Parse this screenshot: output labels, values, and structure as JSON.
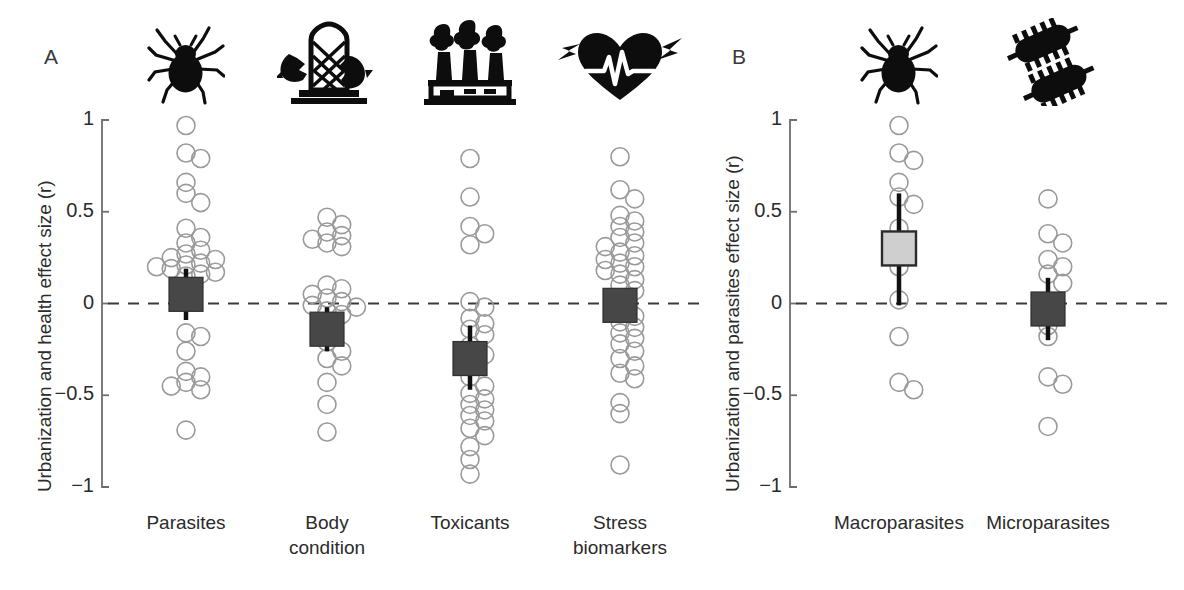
{
  "figure": {
    "width": 1184,
    "height": 590,
    "background": "#ffffff",
    "marker_edge_color": "#9a9a9a",
    "dark_square_color": "#474747",
    "light_square_color": "#cfcfcf",
    "square_edge_color": "#2b2b2b",
    "zero_line_color": "#3a3a3a",
    "axis_color": "#6e6e6e"
  },
  "panels": [
    {
      "letter": "A",
      "ylabel": "Urbanization and health effect size (r)",
      "yticks": [
        "1",
        "0.5",
        "0",
        "−0.5",
        "−1"
      ],
      "ytick_values": [
        1,
        0.5,
        0,
        -0.5,
        -1
      ],
      "ylim": [
        -1,
        1
      ],
      "zero_line": 0,
      "categories": [
        "Parasites",
        "Body\ncondition",
        "Toxicants",
        "Stress\nbiomarkers"
      ],
      "icons": [
        "tick-icon",
        "bird-feeder-icon",
        "factory-smokestack-icon",
        "heart-ecg-lightning-icon"
      ]
    },
    {
      "letter": "B",
      "ylabel": "Urbanization and parasites effect size (r)",
      "yticks": [
        "1",
        "0.5",
        "0",
        "−0.5",
        "−1"
      ],
      "ytick_values": [
        1,
        0.5,
        0,
        -0.5,
        -1
      ],
      "ylim": [
        -1,
        1
      ],
      "zero_line": 0,
      "categories": [
        "Macroparasites",
        "Microparasites"
      ],
      "icons": [
        "tick-icon",
        "bacteria-icon"
      ]
    }
  ],
  "chart_data": {
    "type": "scatter",
    "title": "",
    "subtitle": "",
    "xlabel": "",
    "ylabel_a": "Urbanization and health effect size (r)",
    "ylabel_b": "Urbanization and parasites effect size (r)",
    "ylim": [
      -1,
      1
    ],
    "yticks": [
      -1,
      -0.5,
      0,
      0.5,
      1
    ],
    "grid": false,
    "legend": "none",
    "reference_line": {
      "y": 0,
      "style": "dashed"
    },
    "panels": [
      {
        "letter": "A",
        "ylabel": "Urbanization and health effect size (r)",
        "groups": [
          {
            "name": "Parasites",
            "icon": "tick-icon",
            "summary": {
              "mean": 0.05,
              "ci_low": -0.09,
              "ci_high": 0.19,
              "marker": "filled-dark-square"
            },
            "points": [
              0.97,
              0.82,
              0.79,
              0.66,
              0.6,
              0.55,
              0.41,
              0.36,
              0.33,
              0.29,
              0.27,
              0.25,
              0.24,
              0.22,
              0.21,
              0.2,
              0.19,
              0.17,
              0.16,
              0.15,
              -0.16,
              -0.18,
              -0.26,
              -0.37,
              -0.4,
              -0.43,
              -0.45,
              -0.47,
              -0.69
            ]
          },
          {
            "name": "Body condition",
            "icon": "bird-feeder-icon",
            "summary": {
              "mean": -0.14,
              "ci_low": -0.26,
              "ci_high": -0.02,
              "marker": "filled-dark-square"
            },
            "points": [
              0.47,
              0.43,
              0.39,
              0.37,
              0.35,
              0.33,
              0.31,
              0.1,
              0.08,
              0.05,
              0.03,
              0.01,
              -0.01,
              -0.02,
              -0.04,
              -0.06,
              -0.21,
              -0.26,
              -0.3,
              -0.34,
              -0.43,
              -0.55,
              -0.7
            ]
          },
          {
            "name": "Toxicants",
            "icon": "factory-smokestack-icon",
            "summary": {
              "mean": -0.3,
              "ci_low": -0.47,
              "ci_high": -0.12,
              "marker": "filled-dark-square"
            },
            "points": [
              0.79,
              0.58,
              0.42,
              0.38,
              0.32,
              0.01,
              -0.02,
              -0.08,
              -0.11,
              -0.14,
              -0.17,
              -0.23,
              -0.28,
              -0.34,
              -0.4,
              -0.45,
              -0.49,
              -0.52,
              -0.55,
              -0.58,
              -0.61,
              -0.64,
              -0.68,
              -0.72,
              -0.78,
              -0.85,
              -0.93
            ]
          },
          {
            "name": "Stress biomarkers",
            "icon": "heart-ecg-lightning-icon",
            "summary": {
              "mean": -0.01,
              "ci_low": -0.1,
              "ci_high": 0.07,
              "marker": "filled-dark-square"
            },
            "points": [
              0.8,
              0.62,
              0.57,
              0.48,
              0.45,
              0.42,
              0.39,
              0.36,
              0.33,
              0.31,
              0.28,
              0.26,
              0.24,
              0.22,
              0.2,
              0.18,
              0.16,
              0.13,
              0.1,
              0.07,
              -0.04,
              -0.07,
              -0.1,
              -0.13,
              -0.16,
              -0.19,
              -0.22,
              -0.26,
              -0.3,
              -0.34,
              -0.38,
              -0.41,
              -0.54,
              -0.6,
              -0.88
            ]
          }
        ]
      },
      {
        "letter": "B",
        "ylabel": "Urbanization and parasites effect size (r)",
        "groups": [
          {
            "name": "Macroparasites",
            "icon": "tick-icon",
            "summary": {
              "mean": 0.3,
              "ci_low": -0.01,
              "ci_high": 0.6,
              "marker": "filled-light-square"
            },
            "points": [
              0.97,
              0.82,
              0.78,
              0.66,
              0.58,
              0.54,
              0.41,
              0.33,
              0.2,
              0.02,
              -0.18,
              -0.43,
              -0.47
            ]
          },
          {
            "name": "Microparasites",
            "icon": "bacteria-icon",
            "summary": {
              "mean": -0.03,
              "ci_low": -0.2,
              "ci_high": 0.14,
              "marker": "filled-dark-square"
            },
            "points": [
              0.57,
              0.38,
              0.33,
              0.24,
              0.2,
              0.16,
              0.11,
              -0.12,
              -0.18,
              -0.4,
              -0.44,
              -0.67
            ]
          }
        ]
      }
    ]
  }
}
